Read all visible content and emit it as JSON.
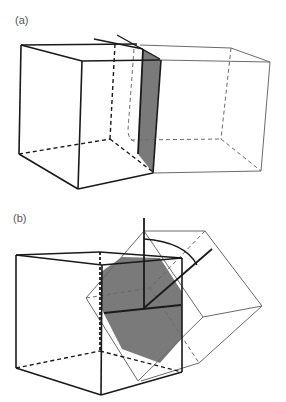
{
  "figure": {
    "panels": [
      {
        "id": "a",
        "label": "(a)",
        "description": "Two cubes sharing a tilted grain boundary plane (shaded), tilt axis in the boundary"
      },
      {
        "id": "b",
        "label": "(b)",
        "description": "Cube with rotated cube overlapping; shaded hexagonal boundary plane with rotation axis normal and rotation arc"
      }
    ]
  },
  "colors": {
    "stroke_dark": "#1a1a1a",
    "stroke_light": "#6a6a6a",
    "shade": "#7a7a7a",
    "background": "#ffffff"
  }
}
